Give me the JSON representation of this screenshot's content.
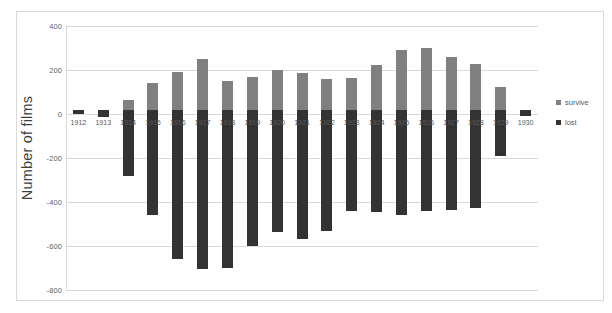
{
  "chart_data": {
    "type": "bar",
    "title": "",
    "subtitle": "",
    "xlabel": "",
    "ylabel": "Number of films",
    "ylim": [
      -800,
      400
    ],
    "yticks": [
      400,
      200,
      0,
      -200,
      -400,
      -600,
      -800
    ],
    "ytick_labels": [
      "400",
      "200",
      "0",
      "-200",
      "-400",
      "-600",
      "-800"
    ],
    "grid": true,
    "stacked": true,
    "legend_position": "right",
    "categories": [
      "1912",
      "1913",
      "1914",
      "1915",
      "1916",
      "1917",
      "1918",
      "1919",
      "1920",
      "1921",
      "1922",
      "1923",
      "1924",
      "1925",
      "1926",
      "1927",
      "1928",
      "1929",
      "1930"
    ],
    "series": [
      {
        "name": "survive",
        "color": "#808080",
        "values": [
          8,
          0,
          62,
          140,
          192,
          248,
          148,
          168,
          198,
          188,
          160,
          162,
          222,
          292,
          298,
          258,
          226,
          124,
          0
        ]
      },
      {
        "name": "lost",
        "color": "#333333",
        "values": [
          0,
          -14,
          -282,
          -458,
          -660,
          -705,
          -700,
          -598,
          -538,
          -568,
          -533,
          -439,
          -446,
          -458,
          -443,
          -435,
          -428,
          -192,
          -10
        ]
      }
    ]
  },
  "legend": {
    "items": [
      {
        "label": "survive",
        "color": "#808080"
      },
      {
        "label": "lost",
        "color": "#333333"
      }
    ]
  },
  "axis": {
    "y_title": "Number of films"
  }
}
